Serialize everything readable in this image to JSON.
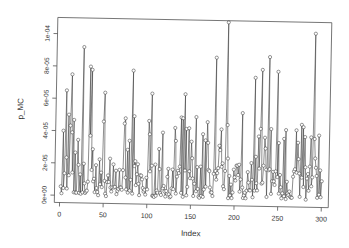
{
  "chart_data": {
    "type": "line",
    "style": "points-and-lines (R type='o')",
    "title": "",
    "xlabel": "Index",
    "ylabel": "p_MC",
    "xlim": [
      -6,
      308
    ],
    "ylim": [
      0,
      0.00011
    ],
    "x_ticks": [
      0,
      50,
      100,
      150,
      200,
      250,
      300
    ],
    "x_tick_labels": [
      "0",
      "50",
      "100",
      "150",
      "200",
      "250",
      "300"
    ],
    "y_ticks": [
      0,
      2e-05,
      4e-05,
      6e-05,
      8e-05,
      0.0001
    ],
    "y_tick_labels": [
      "0e+00",
      "2e-05",
      "4e-05",
      "6e-05",
      "8e-05",
      "1e-04"
    ],
    "grid": false,
    "legend": null,
    "n_points": 300,
    "series": [
      {
        "name": "p_MC",
        "color": "#333333",
        "marker": "open-circle",
        "peaks": [
          {
            "index": 3,
            "value": 4e-05
          },
          {
            "index": 6,
            "value": 6.5e-05
          },
          {
            "index": 9,
            "value": 5e-05
          },
          {
            "index": 12,
            "value": 7.5e-05
          },
          {
            "index": 25,
            "value": 9.2e-05
          },
          {
            "index": 33,
            "value": 8e-05
          },
          {
            "index": 35,
            "value": 7.8e-05
          },
          {
            "index": 50,
            "value": 6.4e-05
          },
          {
            "index": 82,
            "value": 7.8e-05
          },
          {
            "index": 104,
            "value": 6.4e-05
          },
          {
            "index": 117,
            "value": 4e-05
          },
          {
            "index": 132,
            "value": 3.5e-05
          },
          {
            "index": 142,
            "value": 6.4e-05
          },
          {
            "index": 155,
            "value": 5e-05
          },
          {
            "index": 168,
            "value": 4.7e-05
          },
          {
            "index": 177,
            "value": 8.7e-05
          },
          {
            "index": 190,
            "value": 0.000109
          },
          {
            "index": 208,
            "value": 5.3e-05
          },
          {
            "index": 222,
            "value": 7.5e-05
          },
          {
            "index": 230,
            "value": 8e-05
          },
          {
            "index": 238,
            "value": 8.8e-05
          },
          {
            "index": 248,
            "value": 7.9e-05
          },
          {
            "index": 258,
            "value": 4.3e-05
          },
          {
            "index": 270,
            "value": 4.3e-05
          },
          {
            "index": 278,
            "value": 4.5e-05
          },
          {
            "index": 290,
            "value": 0.000103
          },
          {
            "index": 296,
            "value": 4e-05
          }
        ],
        "baseline_range": [
          0.0,
          2.8e-05
        ],
        "seed": 7
      }
    ]
  }
}
